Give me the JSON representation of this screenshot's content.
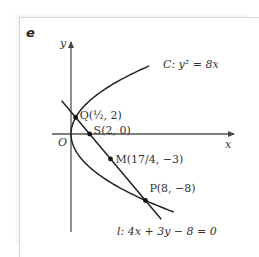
{
  "figure": {
    "tag": "e",
    "axes": {
      "x_label": "x",
      "y_label": "y",
      "origin_label": "O"
    },
    "curve_label": "C: y² = 8x",
    "line_label": "l: 4x + 3y − 8 = 0",
    "points": [
      {
        "name": "Q",
        "label": "Q(½, 2)",
        "x": 0.5,
        "y": 2
      },
      {
        "name": "S",
        "label": "S(2, 0)",
        "x": 2,
        "y": 0
      },
      {
        "name": "M",
        "label": "M(17/4, −3)",
        "x": 4.25,
        "y": -3
      },
      {
        "name": "P",
        "label": "P(8, −8)",
        "x": 8,
        "y": -8
      }
    ],
    "colors": {
      "curve": "#222222",
      "axis": "#555555",
      "point": "#111111",
      "frame": "#d8d8d8"
    }
  }
}
